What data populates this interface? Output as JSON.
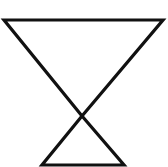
{
  "diagram": {
    "stroke_color": "#111111",
    "background_color": "#ffffff",
    "stroke_width": 3.2,
    "shapes": [
      {
        "name": "upper-inverted-triangle",
        "points": [
          [
            4,
            20
          ],
          [
            163,
            20
          ],
          [
            82,
            116
          ]
        ]
      },
      {
        "name": "lower-triangle",
        "points": [
          [
            82,
            116
          ],
          [
            124,
            165
          ],
          [
            42,
            165
          ]
        ]
      }
    ]
  }
}
